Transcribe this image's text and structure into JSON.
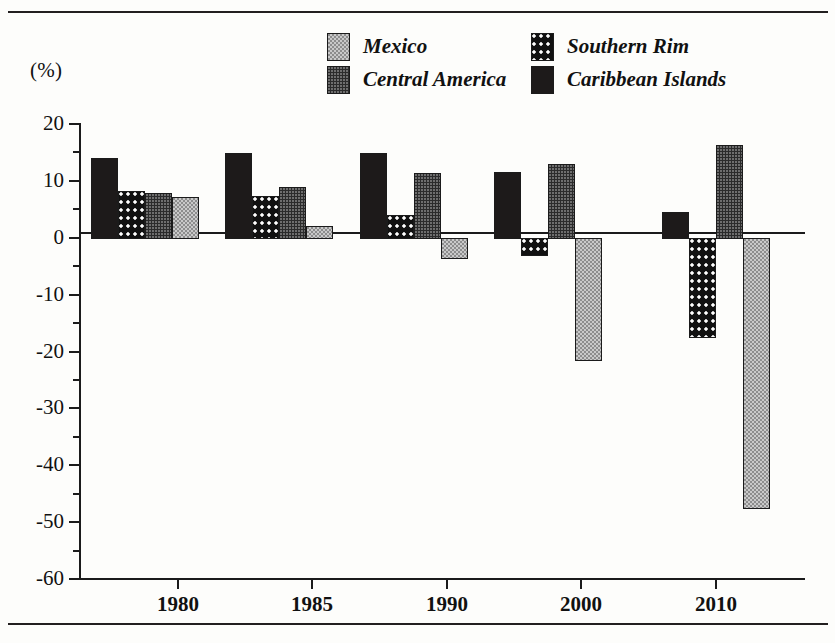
{
  "axis_label": "(%)",
  "legend": {
    "entries": [
      {
        "label": "Mexico",
        "pattern": "pat-mexico",
        "color": "#8d8d8d"
      },
      {
        "label": "Southern Rim",
        "pattern": "pat-southern",
        "color": "#111111"
      },
      {
        "label": "Central America",
        "pattern": "pat-central",
        "color": "#2b2b2b"
      },
      {
        "label": "Caribbean Islands",
        "pattern": "pat-caribbean",
        "color": "#1d1a1a"
      }
    ]
  },
  "yaxis": {
    "labels": [
      "20",
      "10",
      "0",
      "-10",
      "-20",
      "-30",
      "-40",
      "-50",
      "-60"
    ],
    "values": [
      20,
      10,
      0,
      -10,
      -20,
      -30,
      -40,
      -50,
      -60
    ],
    "min": -60,
    "max": 20,
    "minor_step": 5
  },
  "xaxis": {
    "labels": [
      "1980",
      "1985",
      "1990",
      "2000",
      "2010"
    ]
  },
  "chart_data": {
    "type": "bar",
    "title": "",
    "xlabel": "",
    "ylabel": "(%)",
    "ylim": [
      -60,
      20
    ],
    "grid": false,
    "legend_position": "top",
    "categories": [
      "1980",
      "1985",
      "1990",
      "2000",
      "2010"
    ],
    "series_order_in_group": [
      "Caribbean Islands",
      "Southern Rim",
      "Central America",
      "Mexico"
    ],
    "series": [
      {
        "name": "Caribbean Islands",
        "values": [
          14.0,
          14.9,
          14.9,
          11.5,
          4.5
        ]
      },
      {
        "name": "Southern Rim",
        "values": [
          8.3,
          7.3,
          4.0,
          -3.0,
          -17.5
        ]
      },
      {
        "name": "Central America",
        "values": [
          7.8,
          9.0,
          11.3,
          13.0,
          16.3
        ]
      },
      {
        "name": "Mexico",
        "values": [
          7.2,
          2.0,
          -3.5,
          -21.5,
          -47.5
        ]
      }
    ]
  }
}
